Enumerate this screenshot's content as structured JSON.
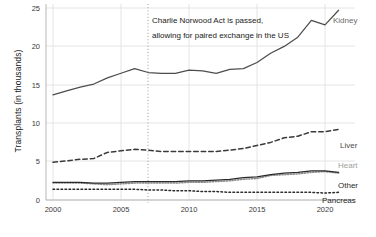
{
  "chart_data": {
    "type": "line",
    "title": "",
    "xlabel": "",
    "ylabel": "Transplants (in thousands)",
    "xlim": [
      2000,
      2021
    ],
    "ylim": [
      0,
      25
    ],
    "yticks": [
      0,
      5,
      10,
      15,
      20,
      25
    ],
    "xticks": [
      2000,
      2005,
      2010,
      2015,
      2020
    ],
    "grid": true,
    "legend_position": "right-inline-labels",
    "x": [
      2000,
      2001,
      2002,
      2003,
      2004,
      2005,
      2006,
      2007,
      2008,
      2009,
      2010,
      2011,
      2012,
      2013,
      2014,
      2015,
      2016,
      2017,
      2018,
      2019,
      2020,
      2021
    ],
    "series": [
      {
        "name": "Kidney",
        "style": "solid",
        "color": "#4d4d4d",
        "values": [
          13.7,
          14.2,
          14.7,
          15.1,
          15.9,
          16.5,
          17.1,
          16.6,
          16.5,
          16.5,
          16.9,
          16.8,
          16.5,
          17.0,
          17.1,
          17.9,
          19.1,
          20.0,
          21.2,
          23.4,
          22.8,
          24.7
        ]
      },
      {
        "name": "Liver",
        "style": "dashed",
        "color": "#3a3a3a",
        "values": [
          4.9,
          5.1,
          5.3,
          5.4,
          6.2,
          6.4,
          6.6,
          6.5,
          6.3,
          6.3,
          6.3,
          6.3,
          6.3,
          6.5,
          6.7,
          7.1,
          7.5,
          8.1,
          8.3,
          8.9,
          8.9,
          9.2
        ]
      },
      {
        "name": "Heart",
        "style": "dotted-fine",
        "color": "#8a8a8a",
        "values": [
          2.2,
          2.2,
          2.2,
          2.1,
          2.0,
          2.1,
          2.2,
          2.2,
          2.2,
          2.2,
          2.3,
          2.3,
          2.4,
          2.5,
          2.7,
          2.8,
          3.2,
          3.3,
          3.4,
          3.6,
          3.7,
          3.5
        ]
      },
      {
        "name": "Other",
        "style": "solid",
        "color": "#2a2a2a",
        "values": [
          2.3,
          2.3,
          2.3,
          2.2,
          2.2,
          2.3,
          2.4,
          2.4,
          2.4,
          2.4,
          2.5,
          2.5,
          2.6,
          2.7,
          2.9,
          3.0,
          3.3,
          3.5,
          3.6,
          3.8,
          3.8,
          3.6
        ]
      },
      {
        "name": "Pancreas",
        "style": "dotted",
        "color": "#2a2a2a",
        "values": [
          1.4,
          1.4,
          1.4,
          1.4,
          1.4,
          1.4,
          1.4,
          1.3,
          1.3,
          1.2,
          1.2,
          1.1,
          1.1,
          1.0,
          1.0,
          1.0,
          1.0,
          1.0,
          1.0,
          1.0,
          0.9,
          1.0
        ]
      }
    ],
    "annotations": [
      {
        "name": "charlie-norwood-act",
        "line1": "Charlie Norwood Act is passed,",
        "line2": "allowing for paired exchange in the US",
        "at_x": 2007,
        "marker": "vertical-dotted-line"
      }
    ]
  }
}
